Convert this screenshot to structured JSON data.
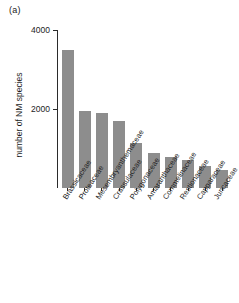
{
  "panel": {
    "label": "(a)"
  },
  "chart_data": {
    "type": "bar",
    "title": "",
    "xlabel": "",
    "ylabel": "number of NM species",
    "ylim": [
      0,
      4000
    ],
    "ytick_labels": [
      "2000",
      "4000"
    ],
    "yticks": [
      2000,
      4000
    ],
    "grid": false,
    "legend": null,
    "bar_color": "#8d8d8d",
    "axis_color": "#2b2b2b",
    "categories": [
      "Brassicaceae",
      "Proteaceae",
      "Mesembryanthemaceae",
      "Crassulaceae",
      "Polygonaceae",
      "Amaranthaceae",
      "Commelinaceae",
      "Restionaceae",
      "Capparaceae",
      "Juncaceae"
    ],
    "values": [
      3500,
      1950,
      1900,
      1700,
      1150,
      880,
      780,
      700,
      550,
      450
    ]
  }
}
